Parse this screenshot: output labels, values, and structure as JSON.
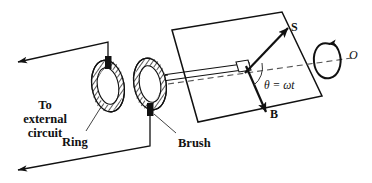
{
  "figure": {
    "background_color": "#ffffff",
    "line_color": "#111111",
    "width": 372,
    "height": 183
  },
  "labels": {
    "external_circuit": "To\nexternal\ncircuit",
    "ring": "Ring",
    "brush": "Brush",
    "flux_vector": "S",
    "field_vector": "B",
    "angle": "θ = ωt",
    "rotation_axis": "O"
  },
  "components": {
    "loop": "rotating-wire-loop",
    "left_ring": "slip-ring-left",
    "right_ring": "slip-ring-right",
    "left_brush": "brush-contact-left",
    "right_brush": "brush-contact-right",
    "shaft": "rotation-shaft",
    "axis": "dashed-rotation-axis",
    "rotation_arrow": "curved-rotation-arrow",
    "lead_top": "lead-wire-top",
    "lead_bottom": "lead-wire-bottom"
  }
}
